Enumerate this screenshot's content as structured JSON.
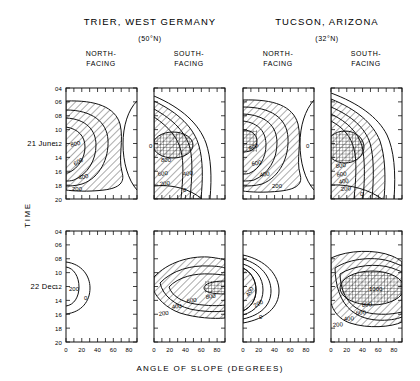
{
  "figure": {
    "xlabel": "ANGLE OF SLOPE (DEGREES)",
    "ylabel": "TIME",
    "x_ticks": [
      "0",
      "20",
      "40",
      "60",
      "80"
    ],
    "y_ticks": [
      "04",
      "06",
      "08",
      "10",
      "12",
      "14",
      "16",
      "18",
      "20"
    ],
    "row_labels": [
      "21 June",
      "22 Dec"
    ],
    "sites": [
      {
        "name": "TRIER, WEST GERMANY",
        "latitude": "(50°N)"
      },
      {
        "name": "TUCSON, ARIZONA",
        "latitude": "(32°N)"
      }
    ],
    "aspects": [
      "NORTH-\nFACING",
      "SOUTH-\nFACING",
      "NORTH-\nFACING",
      "SOUTH-\nFACING"
    ],
    "aspect_line1": "NORTH-",
    "aspect_line1b": "SOUTH-",
    "aspect_line2": "FACING"
  },
  "chart_data": {
    "type": "contour",
    "xlabel": "ANGLE OF SLOPE (DEGREES)",
    "ylabel": "TIME",
    "xlim": [
      0,
      90
    ],
    "ylim": [
      4,
      20
    ],
    "xticks": [
      0,
      20,
      40,
      60,
      80
    ],
    "yticks": [
      4,
      6,
      8,
      10,
      12,
      14,
      16,
      18,
      20
    ],
    "units": "W m-2",
    "grid": false,
    "legend": "none",
    "panels": [
      {
        "id": "trier-north-june",
        "site": "TRIER, WEST GERMANY",
        "latitude": "(50°N)",
        "aspect": "NORTH-FACING",
        "date": "21 June",
        "contour_levels": [
          0,
          200,
          400,
          600,
          800
        ],
        "labels_shown": [
          "800",
          "600",
          "400",
          "200",
          "0"
        ],
        "max_value": 800,
        "hatched": true,
        "cross_hatched": false
      },
      {
        "id": "trier-south-june",
        "site": "TRIER, WEST GERMANY",
        "latitude": "(50°N)",
        "aspect": "SOUTH-FACING",
        "date": "21 June",
        "contour_levels": [
          0,
          200,
          400,
          600,
          800
        ],
        "labels_shown": [
          "800",
          "600",
          "400",
          "200",
          "0"
        ],
        "max_value": 800,
        "hatched": true,
        "cross_hatched": true
      },
      {
        "id": "tucson-north-june",
        "site": "TUCSON, ARIZONA",
        "latitude": "(32°N)",
        "aspect": "NORTH-FACING",
        "date": "21 June",
        "contour_levels": [
          0,
          200,
          400,
          600,
          800
        ],
        "labels_shown": [
          "800",
          "600",
          "400",
          "200",
          "0"
        ],
        "max_value": 800,
        "hatched": true,
        "cross_hatched": true
      },
      {
        "id": "tucson-south-june",
        "site": "TUCSON, ARIZONA",
        "latitude": "(32°N)",
        "aspect": "SOUTH-FACING",
        "date": "21 June",
        "contour_levels": [
          0,
          200,
          400,
          600,
          800
        ],
        "labels_shown": [
          "800",
          "600",
          "400",
          "200",
          "0"
        ],
        "max_value": 800,
        "hatched": true,
        "cross_hatched": true
      },
      {
        "id": "trier-north-dec",
        "site": "TRIER, WEST GERMANY",
        "latitude": "(50°N)",
        "aspect": "NORTH-FACING",
        "date": "22 Dec",
        "contour_levels": [
          0,
          200
        ],
        "labels_shown": [
          "200",
          "0"
        ],
        "max_value": 200,
        "hatched": false,
        "cross_hatched": false
      },
      {
        "id": "trier-south-dec",
        "site": "TRIER, WEST GERMANY",
        "latitude": "(50°N)",
        "aspect": "SOUTH-FACING",
        "date": "22 Dec",
        "contour_levels": [
          0,
          200,
          400,
          600,
          800
        ],
        "labels_shown": [
          "800",
          "600",
          "400",
          "200"
        ],
        "max_value": 800,
        "hatched": true,
        "cross_hatched": true
      },
      {
        "id": "tucson-north-dec",
        "site": "TUCSON, ARIZONA",
        "latitude": "(32°N)",
        "aspect": "NORTH-FACING",
        "date": "22 Dec",
        "contour_levels": [
          0,
          200,
          400
        ],
        "labels_shown": [
          "400",
          "200",
          "0"
        ],
        "max_value": 400,
        "hatched": true,
        "cross_hatched": false
      },
      {
        "id": "tucson-south-dec",
        "site": "TUCSON, ARIZONA",
        "latitude": "(32°N)",
        "aspect": "SOUTH-FACING",
        "date": "22 Dec",
        "contour_levels": [
          0,
          200,
          400,
          600,
          800,
          1000
        ],
        "labels_shown": [
          "1000",
          "800",
          "600",
          "400",
          "200"
        ],
        "max_value": 1000,
        "hatched": true,
        "cross_hatched": true
      }
    ]
  }
}
